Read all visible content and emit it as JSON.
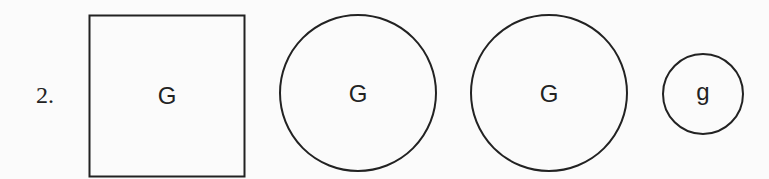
{
  "item_number": "2.",
  "shapes": [
    {
      "type": "square",
      "letter": "G"
    },
    {
      "type": "circle",
      "letter": "G"
    },
    {
      "type": "circle",
      "letter": "G"
    },
    {
      "type": "circle-small",
      "letter": "g"
    }
  ],
  "colors": {
    "stroke": "#222222",
    "background": "#fbfbfb"
  }
}
